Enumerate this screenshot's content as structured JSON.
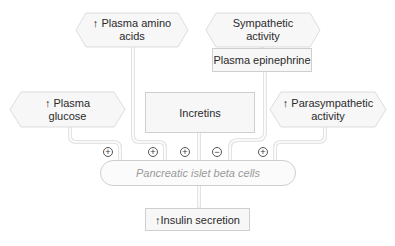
{
  "diagram": {
    "nodes": {
      "amino_acids": {
        "label": "↑ Plasma amino acids",
        "line1": "↑ Plasma amino",
        "line2": "acids"
      },
      "sympathetic": {
        "label": "Sympathetic activity",
        "line1": "Sympathetic",
        "line2": "activity"
      },
      "epinephrine": {
        "label": "Plasma epinephrine"
      },
      "glucose": {
        "label": "↑ Plasma glucose",
        "line1": "↑ Plasma",
        "line2": "glucose"
      },
      "incretins": {
        "label": "Incretins"
      },
      "parasympathetic": {
        "label": "↑ Parasympathetic activity",
        "line1": "↑ Parasympathetic",
        "line2": "activity"
      },
      "beta_cells": {
        "label": "Pancreatic islet beta cells"
      },
      "insulin": {
        "label": "↑Insulin secretion"
      }
    },
    "signs": {
      "glucose": "+",
      "amino_acids": "+",
      "incretins": "+",
      "epinephrine": "−",
      "parasympathetic": "+"
    },
    "colors": {
      "box_fill": "#f7f7f7",
      "border": "#cfcfcf",
      "connector": "#e6e6e6",
      "muted_text": "#9a9a9a"
    }
  }
}
